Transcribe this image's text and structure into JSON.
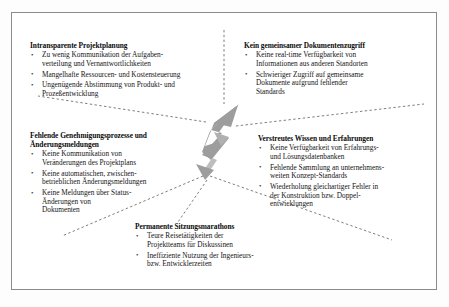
{
  "diagram": {
    "center_icon": "lightning-bolt-icon",
    "colors": {
      "bolt_fill": "#9d9d9d",
      "bolt_fill_light": "#b8b8b8",
      "connector": "#6e6e6e",
      "frame": "#8b8b8b",
      "text": "#111111"
    },
    "blocks": [
      {
        "id": "planung",
        "title": "Intransparente Projektplanung",
        "bullet_glyph": "•",
        "items": [
          "Zu wenig Kommunikation der Aufgaben-\nverteilung und Vernantwortlichkeiten",
          "Mangelhafte Ressourcen- und Kostensteuerung",
          "Ungenügende Abstimmung von Produkt- und\nProzeßentwicklung"
        ]
      },
      {
        "id": "dokument",
        "title": "Kein gemeinsamer Dokumentenzugriff",
        "bullet_glyph": "•",
        "items": [
          "Keine real-time Verfügbarkeit von\nInformationen aus anderen Standorten",
          "Schwieriger Zugriff auf gemeinsame\nDokumente aufgrund fehlender\nStandards"
        ]
      },
      {
        "id": "genehmigung",
        "title": "Fehlende Genehmigungsprozesse und\nÄnderungsmeldungen",
        "bullet_glyph": "•",
        "items": [
          "Keine Kommunikation von\nVeränderungen des Projektplans",
          "Keine automatischen, zwischen-\nbetrieblichen Änderungsmeldungen",
          "Keine Meldungen über Status-\nÄnderungen von\nDokumenten"
        ]
      },
      {
        "id": "wissen",
        "title": "Verstreutes Wissen und Erfahrungen",
        "bullet_glyph": "•",
        "items": [
          "Keine Verfügbarkeit von Erfahrungs-\nund Lösungsdatenbanken",
          "Fehlende Sammlung an unternehmens-\nweiten Konzept-Standards",
          "Wiederholung gleichartiger Fehler in\nder Konstruktion bzw. Doppel-\nentwicklungen"
        ]
      },
      {
        "id": "sitzungen",
        "title": "Permanente Sitzungsmarathons",
        "bullet_glyph": "•",
        "items": [
          "Teure Reisetätigkeiten der\nProjektteams für Diskussinen",
          "Ineffiziente Nutzung der Ingenieurs-\nbzw. Entwicklerzeiten"
        ]
      }
    ]
  }
}
